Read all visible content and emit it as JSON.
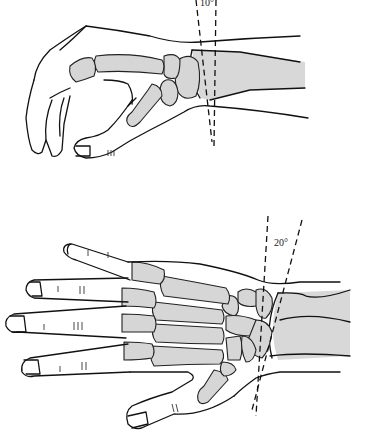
{
  "figure": {
    "panels": [
      {
        "id": "lateral-view",
        "angle_label": "10°",
        "description": "Lateral view of hand and wrist with dashed reference lines"
      },
      {
        "id": "dorsal-view",
        "angle_label": "20°",
        "description": "Dorsal (PA) view of hand and wrist skeleton with dashed reference lines"
      }
    ],
    "colors": {
      "line": "#111111",
      "bone_fill": "#d6d6d6",
      "background": "#ffffff"
    }
  }
}
